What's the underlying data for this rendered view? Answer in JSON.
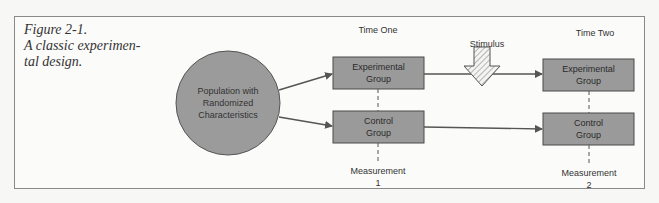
{
  "figure": {
    "label": "Figure 2-1.",
    "caption_line1": "A classic experimen-",
    "caption_line2": "tal design."
  },
  "diagram": {
    "population": {
      "line1": "Population with",
      "line2": "Randomized",
      "line3": "Characteristics"
    },
    "time_one": {
      "header": "Time One",
      "experimental": {
        "line1": "Experimental",
        "line2": "Group"
      },
      "control": {
        "line1": "Control",
        "line2": "Group"
      },
      "measurement": {
        "label": "Measurement",
        "number": "1"
      }
    },
    "time_two": {
      "header": "Time Two",
      "experimental": {
        "line1": "Experimental",
        "line2": "Group"
      },
      "control": {
        "line1": "Control",
        "line2": "Group"
      },
      "measurement": {
        "label": "Measurement",
        "number": "2"
      }
    },
    "stimulus": {
      "label": "Stimulus"
    },
    "colors": {
      "shape_fill": "#9a9a9a",
      "box_border": "#4a4a4a",
      "arrow": "#555555",
      "frame": "#8a8a8a"
    }
  }
}
